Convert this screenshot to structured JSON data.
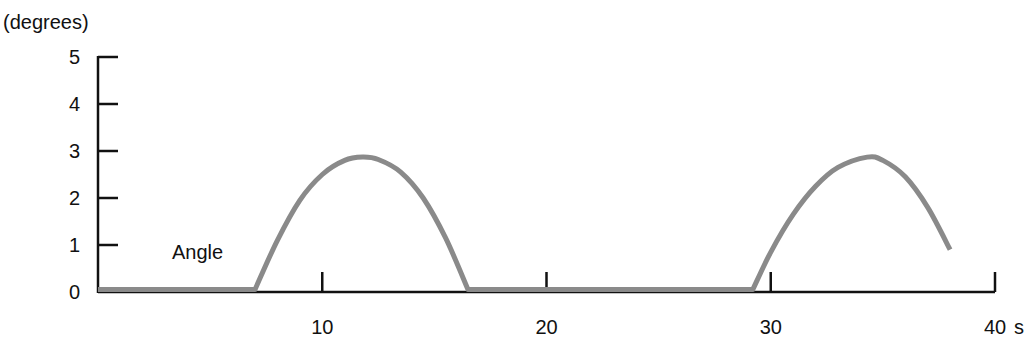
{
  "chart_data": {
    "type": "line",
    "title": "",
    "xlabel": "s",
    "ylabel": "(degrees)",
    "xlim": [
      0,
      40
    ],
    "ylim": [
      0,
      5
    ],
    "grid": false,
    "legend": "none",
    "x_ticks": [
      10,
      20,
      30,
      40
    ],
    "x_tick_labels": [
      "10",
      "20",
      "30",
      "40"
    ],
    "y_ticks": [
      0,
      1,
      2,
      3,
      4,
      5
    ],
    "y_tick_labels": [
      "0",
      "1",
      "2",
      "3",
      "4",
      "5"
    ],
    "annotations": [
      {
        "text": "Angle",
        "x": 3.5,
        "y": 0.8
      }
    ],
    "series": [
      {
        "name": "Angle",
        "color": "#8a8a8a",
        "x": [
          0,
          7.0,
          8.0,
          9.0,
          10.0,
          11.0,
          11.8,
          12.5,
          13.5,
          14.5,
          15.5,
          16.5,
          20,
          25,
          29.2,
          30.0,
          31.0,
          32.0,
          33.0,
          34.3,
          35.0,
          36.0,
          37.0,
          38.0
        ],
        "values": [
          0.05,
          0.05,
          1.1,
          1.95,
          2.5,
          2.8,
          2.87,
          2.82,
          2.55,
          2.0,
          1.15,
          0.05,
          0.05,
          0.05,
          0.05,
          0.85,
          1.65,
          2.25,
          2.65,
          2.87,
          2.8,
          2.45,
          1.8,
          0.9
        ]
      }
    ]
  },
  "labels": {
    "y_unit": "(degrees)",
    "x_unit": "s",
    "series_label": "Angle"
  }
}
